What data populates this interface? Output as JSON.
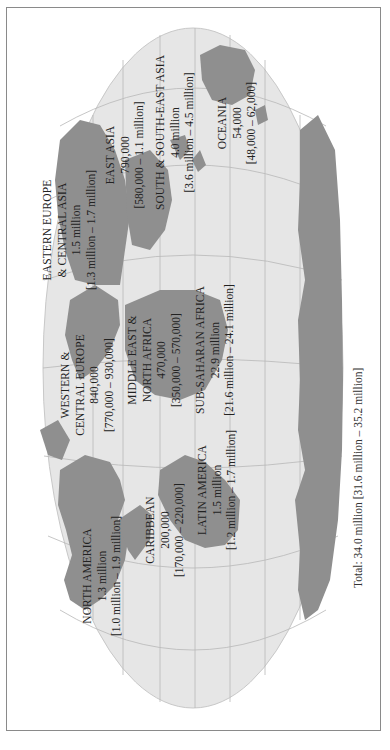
{
  "map": {
    "orientation": "rotated-90-ccw",
    "colors": {
      "ocean": "#e6e6e6",
      "land": "#8f8f8f",
      "graticule": "#b8b8b8",
      "border": "#8a8a8a",
      "text": "#222222"
    },
    "regions": [
      {
        "name": "NORTH AMERICA",
        "value": "1.3 million",
        "range": "[1.0 million – 1.9 million]"
      },
      {
        "name": "CARIBBEAN",
        "value": "200,000",
        "range": "[170,000 – 220,000]"
      },
      {
        "name": "LATIN AMERICA",
        "value": "1.5 million",
        "range": "[1.2 million – 1.7 million]"
      },
      {
        "name_line1": "WESTERN &",
        "name_line2": "CENTRAL EUROPE",
        "value": "840,000",
        "range": "[770,000 – 930,000]"
      },
      {
        "name_line1": "MIDDLE EAST &",
        "name_line2": "NORTH AFRICA",
        "value": "470,000",
        "range": "[350,000 – 570,000]"
      },
      {
        "name": "SUB-SAHARAN AFRICA",
        "value": "22.9 million",
        "range": "[21.6 million – 24.1 million]"
      },
      {
        "name_line1": "EASTERN EUROPE",
        "name_line2": "& CENTRAL ASIA",
        "value": "1.5 million",
        "range": "[1.3 million – 1.7 million]"
      },
      {
        "name": "EAST ASIA",
        "value": "790,000",
        "range": "[580,000 – 1.1 million]"
      },
      {
        "name": "SOUTH & SOUTH-EAST ASIA",
        "value": "4.0 million",
        "range": "[3.6 million – 4.5 million]"
      },
      {
        "name": "OCEANIA",
        "value": "54,000",
        "range": "[48,000 – 62,000]"
      }
    ],
    "total": "Total: 34.0 million [31.6 million – 35.2 million]"
  }
}
